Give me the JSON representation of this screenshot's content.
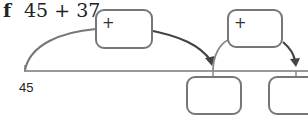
{
  "question": {
    "letter": "f",
    "expression": "45 + 37"
  },
  "number_line": {
    "start_label": "45",
    "jumps": [
      {
        "operator": "+",
        "value": ""
      },
      {
        "operator": "+",
        "value": ""
      }
    ],
    "answer_boxes": [
      {
        "value": ""
      },
      {
        "value": ""
      }
    ]
  }
}
